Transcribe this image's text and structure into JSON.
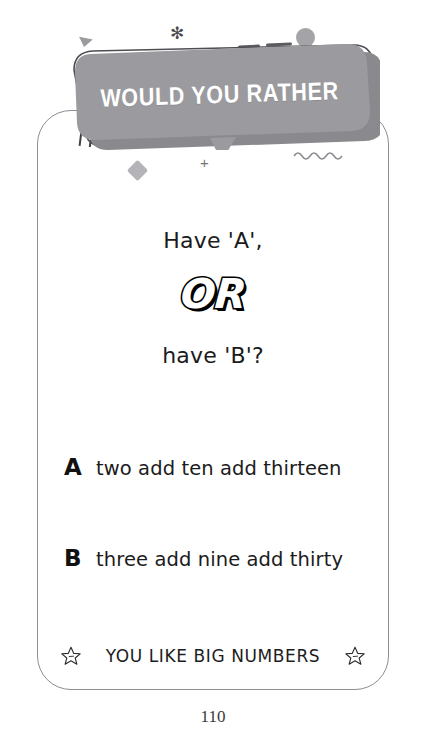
{
  "card": {
    "banner": {
      "title": "WOULD YOU RATHER",
      "fill_color": "#9b9b9f",
      "shadow_color": "#8a8a8e",
      "text_color": "#ffffff"
    },
    "question": {
      "line1": "Have 'A',",
      "connector": "OR",
      "line2": "have 'B'?"
    },
    "options": [
      {
        "letter": "A",
        "text": "two add ten add thirteen"
      },
      {
        "letter": "B",
        "text": "three add nine add thirty"
      }
    ],
    "footer": {
      "label": "YOU LIKE BIG NUMBERS",
      "left_icon": "star-icon",
      "right_icon": "star-icon"
    },
    "border_color": "#8d8d92"
  },
  "decorations": {
    "triangle": "triangle-icon",
    "sparkle": "sparkle-icon",
    "circle": "circle-icon",
    "diamond": "diamond-icon",
    "plus": "+",
    "asterisk": "✳",
    "wave": "wave-icon",
    "zigzag": "zigzag-icon",
    "dashes": "dash-icon",
    "color": "#9a9a9f"
  },
  "page_number": "110"
}
